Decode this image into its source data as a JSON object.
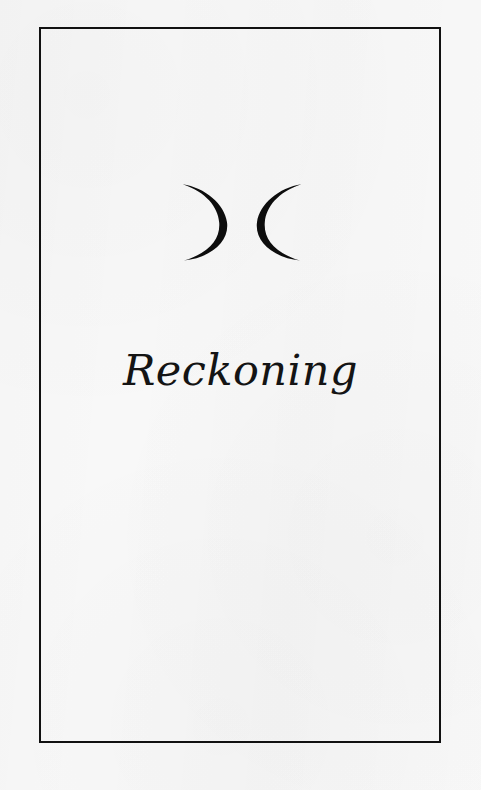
{
  "page": {
    "kind": "book-page-scan",
    "background_color": "#f8f8f8",
    "ink_color": "#111111"
  },
  "frame": {
    "name": "page-border-rule",
    "color": "#111111",
    "thickness_px": 2
  },
  "ornament": {
    "name": "double-crescent-moon-ornament",
    "description": "two outlined crescent moons facing away from each other",
    "color": "#0d0d0d",
    "left_moon": {
      "name": "waxing-crescent-moon-icon",
      "facing": "right",
      "glyph": ")"
    },
    "right_moon": {
      "name": "waning-crescent-moon-icon",
      "facing": "left",
      "glyph": "("
    }
  },
  "title": {
    "text": "Reckoning",
    "style": "italic-calligraphic-serif",
    "color": "#141414"
  }
}
